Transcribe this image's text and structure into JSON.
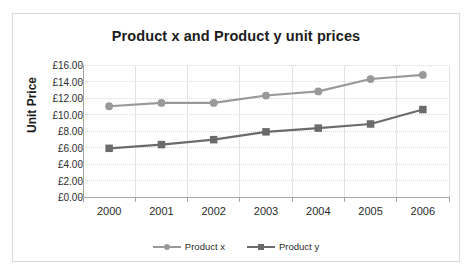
{
  "chart_data": {
    "type": "line",
    "title": "Product x and Product y unit prices",
    "xlabel": "",
    "ylabel": "Unit Price",
    "categories": [
      "2000",
      "2001",
      "2002",
      "2003",
      "2004",
      "2005",
      "2006"
    ],
    "series": [
      {
        "name": "Product x",
        "marker": "circle",
        "color": "#999999",
        "values": [
          11.0,
          11.4,
          11.4,
          12.3,
          12.8,
          14.3,
          14.8
        ]
      },
      {
        "name": "Product y",
        "marker": "square",
        "color": "#6b6b6b",
        "values": [
          5.9,
          6.35,
          6.95,
          7.9,
          8.35,
          8.85,
          10.6
        ]
      }
    ],
    "ylim": [
      0,
      16
    ],
    "ytick_step": 2,
    "ytick_labels": [
      "£0.00",
      "£2.00",
      "£4.00",
      "£6.00",
      "£8.00",
      "£10.00",
      "£12.00",
      "£14.00",
      "£16.00"
    ],
    "ytick_values": [
      0,
      2,
      4,
      6,
      8,
      10,
      12,
      14,
      16
    ],
    "grid": true,
    "grid_color": "#d9d9d9",
    "axis_color": "#a6a6a6",
    "legend_position": "bottom",
    "plot_background": "#ffffff"
  }
}
